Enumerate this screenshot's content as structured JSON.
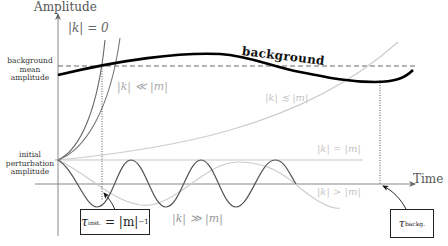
{
  "axes": {
    "y_title": "Amplitude",
    "x_title": "Time"
  },
  "side_labels": {
    "background_mean": "background mean amplitude",
    "background_mean_lines": [
      "background",
      "mean",
      "amplitude"
    ],
    "initial_perturbation": "initial perturbation amplitude",
    "initial_perturbation_lines": [
      "initial",
      "perturbation",
      "amplitude"
    ]
  },
  "curves": {
    "background": {
      "label": "background",
      "color": "#000000"
    },
    "k_zero": {
      "label": "|k| = 0",
      "color": "#666666"
    },
    "k_much_less": {
      "label": "|k| ≪ |m|",
      "color": "#888888"
    },
    "k_less_eq": {
      "label": "|k| ≲ |m|",
      "color": "#c8c8c8"
    },
    "k_equal": {
      "label": "|k| = |m|",
      "color": "#c8c8c8"
    },
    "k_greater": {
      "label": "|k| > |m|",
      "color": "#c8c8c8"
    },
    "k_much_greater": {
      "label": "|k| ≫ |m|",
      "color": "#555555"
    }
  },
  "timescales": {
    "instability": {
      "symbol": "τ",
      "subscript": "inst.",
      "rhs": "= |m|",
      "exponent": "−1"
    },
    "background": {
      "symbol": "τ",
      "subscript": "backg."
    }
  },
  "colors": {
    "axis": "#777777",
    "dashed": "#555555",
    "background_curve": "#000000",
    "dark_curve": "#555555",
    "light_curve": "#cccccc"
  }
}
